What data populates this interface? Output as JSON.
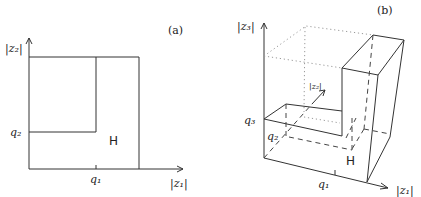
{
  "figure": {
    "panel_a": {
      "tag": "(a)",
      "x_axis_label": "|z₁|",
      "y_axis_label": "|z₂|",
      "x_tick_label": "q₁",
      "y_tick_label": "q₂",
      "region_label": "H"
    },
    "panel_b": {
      "tag": "(b)",
      "x_axis_label": "|z₁|",
      "depth_axis_label": "|z₂|",
      "z_axis_label": "|z₃|",
      "x_tick_label": "q₁",
      "depth_tick_label": "q₂",
      "z_tick_label": "q₃",
      "region_label": "H"
    },
    "colors": {
      "line": "#333333",
      "hidden_line": "#444444",
      "dotted_guide": "#9a9a9a"
    }
  }
}
